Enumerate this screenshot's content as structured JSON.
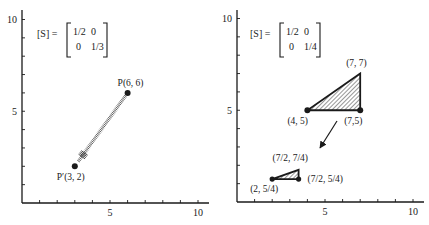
{
  "panels": [
    {
      "id": "left",
      "origin_px": [
        22,
        203
      ],
      "unit_px": [
        17.6,
        18.35
      ],
      "y_top_px": 10,
      "x_end_px": 209,
      "x_ticks": [
        1,
        2,
        3,
        4,
        5,
        6,
        7,
        8,
        9,
        10
      ],
      "y_ticks": [
        1,
        2,
        3,
        4,
        5,
        6,
        7,
        8,
        9,
        10
      ],
      "x_tick_labels": [
        {
          "value": 5,
          "label": "5"
        },
        {
          "value": 10,
          "label": "10"
        }
      ],
      "y_tick_labels": [
        {
          "value": 5,
          "label": "5"
        },
        {
          "value": 10,
          "label": "10"
        }
      ],
      "matrix": {
        "label": "[S] =",
        "rows": [
          [
            "1/2",
            "0"
          ],
          [
            "0",
            "1/3"
          ]
        ],
        "pos_px": [
          37,
          23
        ]
      },
      "points": [
        {
          "name": "P",
          "x": 6,
          "y": 6,
          "label": "P(6, 6)",
          "label_dx": -10,
          "label_dy": -7
        },
        {
          "name": "P-prime",
          "x": 3,
          "y": 2,
          "label": "P′(3, 2)",
          "label_dx": -18,
          "label_dy": 14
        }
      ],
      "arrow": {
        "from": [
          6,
          6
        ],
        "to": [
          3,
          2
        ],
        "style": "hatched"
      }
    },
    {
      "id": "right",
      "origin_px": [
        237,
        202
      ],
      "unit_px": [
        17.6,
        18.35
      ],
      "y_top_px": 10,
      "x_end_px": 424,
      "x_ticks": [
        1,
        2,
        3,
        4,
        5,
        6,
        7,
        8,
        9,
        10
      ],
      "y_ticks": [
        1,
        2,
        3,
        4,
        5,
        6,
        7,
        8,
        9,
        10
      ],
      "x_tick_labels": [
        {
          "value": 5,
          "label": "5"
        },
        {
          "value": 10,
          "label": "10"
        }
      ],
      "y_tick_labels": [
        {
          "value": 5,
          "label": "5"
        },
        {
          "value": 10,
          "label": "10"
        }
      ],
      "matrix": {
        "label": "[S] =",
        "rows": [
          [
            "1/2",
            "0"
          ],
          [
            "0",
            "1/4"
          ]
        ],
        "pos_px": [
          250,
          23
        ]
      },
      "triangles": [
        {
          "name": "original-triangle",
          "vertices": [
            [
              4,
              5
            ],
            [
              7,
              5
            ],
            [
              7,
              7
            ]
          ],
          "labels": [
            {
              "text": "(4, 5)",
              "dx": -20,
              "dy": 14
            },
            {
              "text": "(7,5)",
              "dx": -16,
              "dy": 14
            },
            {
              "text": "(7, 7)",
              "dx": -14,
              "dy": -8
            }
          ]
        },
        {
          "name": "scaled-triangle",
          "vertices": [
            [
              2,
              1.25
            ],
            [
              3.5,
              1.25
            ],
            [
              3.5,
              1.75
            ]
          ],
          "labels": [
            {
              "text": "(2, 5/4)",
              "dx": -22,
              "dy": 13
            },
            {
              "text": "(7/2, 5/4)",
              "dx": 9,
              "dy": 3
            },
            {
              "text": "(7/2, 7/4)",
              "dx": -26,
              "dy": -9
            }
          ]
        }
      ],
      "arrow": {
        "from_px": [
          337,
          121
        ],
        "to_px": [
          320,
          148
        ],
        "style": "solid"
      }
    }
  ],
  "colors": {
    "ink": "#1a1a1a",
    "background": "#ffffff"
  }
}
